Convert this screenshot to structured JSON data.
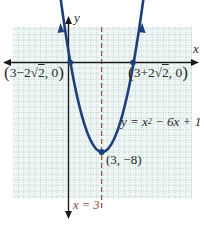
{
  "chart_data": {
    "type": "line",
    "title": "",
    "function": "y = x^2 - 6x + 1",
    "xlabel": "x",
    "ylabel": "y",
    "xlim": [
      -5,
      11
    ],
    "ylim": [
      -12,
      3
    ],
    "grid": true,
    "series": [
      {
        "name": "y = x^2 - 6x + 1",
        "color": "#1f3f7a",
        "x": [
          -0.5,
          0,
          0.17,
          1,
          2,
          3,
          4,
          5,
          5.83,
          6,
          6.5
        ],
        "y": [
          4.25,
          1,
          0,
          -4,
          -7,
          -8,
          -7,
          -4,
          0,
          1,
          4.25
        ]
      }
    ],
    "points": [
      {
        "label": "(3-2√2, 0)",
        "x": 0.17,
        "y": 0
      },
      {
        "label": "(3+2√2, 0)",
        "x": 5.83,
        "y": 0
      },
      {
        "label": "(3, -8)",
        "x": 3,
        "y": -8
      }
    ],
    "axis_of_symmetry": {
      "label": "x = 3",
      "x": 3,
      "color": "#a0564a",
      "style": "dashed"
    }
  },
  "labels": {
    "y_axis": "y",
    "x_axis": "x",
    "root_left": {
      "open": "(",
      "pre": "3−2",
      "rad": "2",
      "post": ", 0",
      "close": ")"
    },
    "root_right": {
      "open": "(",
      "pre": "3+2",
      "rad": "2",
      "post": ", 0",
      "close": ")"
    },
    "equation": {
      "lhs": "y = x",
      "exp": "2",
      "rhs": " − 6x + 1"
    },
    "vertex": "(3, −8)",
    "axis_symmetry": "x = 3"
  },
  "colors": {
    "curve": "#1f3f7a",
    "grid": "#9fb9b4",
    "grid_bg": "#eef7f5",
    "axis": "#1a1a1a",
    "symmetry": "#a0564a"
  }
}
